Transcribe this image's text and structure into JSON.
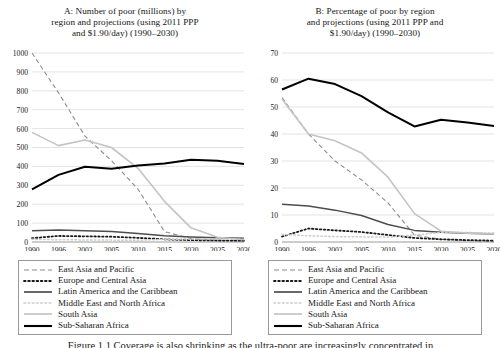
{
  "figure": {
    "caption": "Figure 1.1 Coverage is also shrinking as the ultra-poor are increasingly concentrated in",
    "series_names": [
      "East Asia and Pacific",
      "Europe and Central Asia",
      "Latin America and the Caribbean",
      "Middle East and North Africa",
      "South Asia",
      "Sub-Saharan Africa"
    ],
    "legend_styles": [
      "dashed",
      "dotted-bold",
      "solid-dark",
      "dotted-light",
      "solid-light",
      "solid-black-thick"
    ],
    "colors": {
      "east_asia_pacific": "#8c8c8c",
      "europe_central_asia": "#1a1a1a",
      "latin_america_caribbean": "#4d4d4d",
      "middle_east_north_africa": "#cccccc",
      "south_asia": "#c4c4c4",
      "sub_saharan_africa": "#000000",
      "gridline": "#d9d9d9",
      "axis": "#a6a6a6",
      "text": "#161616"
    }
  },
  "chart_data": [
    {
      "type": "line",
      "panel": "A",
      "title": "A: Number of poor (millions) by region and projections (using 2011 PPP and $1.90/day) (1990–2030)",
      "title_lines": [
        "A: Number of poor (millions) by",
        "region and projections (using 2011 PPP",
        "and $1.90/day) (1990–2030)"
      ],
      "xlabel": "",
      "ylabel": "",
      "categories": [
        1990,
        1996,
        2002,
        2005,
        2010,
        2015,
        2020,
        2025,
        2030
      ],
      "xticklabels": [
        "1990",
        "1996",
        "2002",
        "2005",
        "2010",
        "2015",
        "2020",
        "2025",
        "2030"
      ],
      "ylim": [
        0,
        1000
      ],
      "yticks": [
        0,
        100,
        200,
        300,
        400,
        500,
        600,
        700,
        800,
        900,
        1000
      ],
      "yticklabels": [
        "0",
        "100",
        "200",
        "300",
        "400",
        "500",
        "600",
        "700",
        "800",
        "900",
        "1000"
      ],
      "grid": true,
      "legend_position": "below",
      "series": [
        {
          "name": "East Asia and Pacific",
          "style": "dashed",
          "color": "#8c8c8c",
          "values": [
            1000,
            790,
            560,
            430,
            280,
            55,
            18,
            10,
            6
          ]
        },
        {
          "name": "Europe and Central Asia",
          "style": "dotted-bold",
          "color": "#1a1a1a",
          "values": [
            20,
            32,
            30,
            28,
            22,
            14,
            10,
            8,
            7
          ]
        },
        {
          "name": "Latin America and the Caribbean",
          "style": "solid-dark",
          "color": "#4d4d4d",
          "values": [
            60,
            63,
            60,
            55,
            45,
            33,
            26,
            22,
            20
          ]
        },
        {
          "name": "Middle East and North Africa",
          "style": "dotted-light",
          "color": "#cccccc",
          "values": [
            14,
            12,
            11,
            10,
            9,
            14,
            16,
            16,
            15
          ]
        },
        {
          "name": "South Asia",
          "style": "solid-light",
          "color": "#c4c4c4",
          "values": [
            580,
            510,
            540,
            500,
            390,
            215,
            75,
            25,
            12
          ]
        },
        {
          "name": "Sub-Saharan Africa",
          "style": "solid-black-thick",
          "color": "#000000",
          "values": [
            278,
            355,
            398,
            388,
            405,
            415,
            435,
            430,
            413
          ]
        }
      ]
    },
    {
      "type": "line",
      "panel": "B",
      "title": "B: Percentage of poor by region and projections (using 2011 PPP and $1.90/day) (1990–2030)",
      "title_lines": [
        "B: Percentage of poor by region",
        "and projections (using 2011 PPP and",
        "$1.90/day) (1990–2030)"
      ],
      "xlabel": "",
      "ylabel": "",
      "categories": [
        1990,
        1996,
        2002,
        2005,
        2010,
        2015,
        2020,
        2025,
        2030
      ],
      "xticklabels": [
        "1990",
        "1996",
        "2002",
        "2005",
        "2010",
        "2015",
        "2020",
        "2025",
        "2030"
      ],
      "ylim": [
        0,
        70
      ],
      "yticks": [
        0,
        10,
        20,
        30,
        40,
        50,
        60,
        70
      ],
      "yticklabels": [
        "0",
        "10",
        "20",
        "30",
        "40",
        "50",
        "60",
        "70"
      ],
      "grid": true,
      "legend_position": "below",
      "series": [
        {
          "name": "East Asia and Pacific",
          "style": "dashed",
          "color": "#8c8c8c",
          "values": [
            53.5,
            40.0,
            30.0,
            23.0,
            14.5,
            2.5,
            1.0,
            0.5,
            0.3
          ]
        },
        {
          "name": "Europe and Central Asia",
          "style": "dotted-bold",
          "color": "#1a1a1a",
          "values": [
            2.0,
            5.0,
            4.3,
            3.7,
            2.6,
            1.5,
            1.0,
            0.7,
            0.5
          ]
        },
        {
          "name": "Latin America and the Caribbean",
          "style": "solid-dark",
          "color": "#4d4d4d",
          "values": [
            14.0,
            13.3,
            11.8,
            9.8,
            6.5,
            4.3,
            3.6,
            3.2,
            3.0
          ]
        },
        {
          "name": "Middle East and North Africa",
          "style": "dotted-light",
          "color": "#cccccc",
          "values": [
            2.8,
            2.3,
            2.0,
            1.9,
            1.8,
            2.6,
            3.5,
            3.5,
            3.3
          ]
        },
        {
          "name": "South Asia",
          "style": "solid-light",
          "color": "#c4c4c4",
          "values": [
            53.0,
            40.0,
            37.5,
            33.0,
            24.0,
            10.5,
            4.0,
            3.3,
            3.0
          ]
        },
        {
          "name": "Sub-Saharan Africa",
          "style": "solid-black-thick",
          "color": "#000000",
          "values": [
            56.5,
            60.5,
            58.5,
            54.0,
            48.0,
            42.8,
            45.3,
            44.3,
            43.0
          ]
        }
      ]
    }
  ]
}
